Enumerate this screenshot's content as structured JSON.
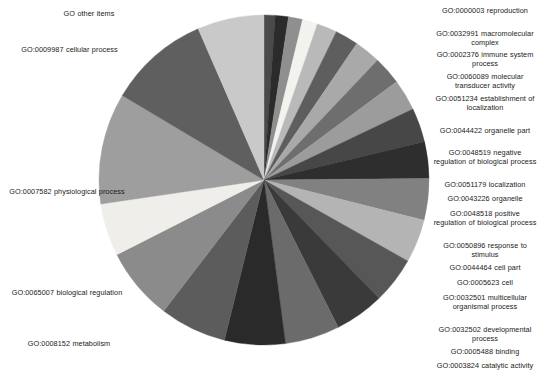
{
  "chart_data": {
    "type": "pie",
    "title": "",
    "legend_position": "outside-labels",
    "grid": false,
    "center": {
      "x": 264,
      "y": 180
    },
    "radius": 165,
    "start_angle_deg": -90,
    "direction": "clockwise",
    "categories": [
      "GO:0000003 reproduction",
      "GO:0032991 macromolecular complex",
      "GO:0002376 immune system process",
      "GO:0060089 molecular transducer activity",
      "GO:0051234 establishment of localization",
      "GO:0044422 organelle part",
      "GO:0048519 negative regulation of biological process",
      "GO:0051179 localization",
      "GO:0043226 organelle",
      "GO:0048518 positive regulation of biological process",
      "GO:0050896 response to stimulus",
      "GO:0044464 cell part",
      "GO:0005623 cell",
      "GO:0032501 multicellular organismal process",
      "GO:0032502 developmental process",
      "GO:0005488 binding",
      "GO:0003824 catalytic activity",
      "GO:0050789 regulation of biological process",
      "GO:0008152 metabolism",
      "GO:0065007 biological regulation",
      "GO:0007582 physiological process",
      "GO:0009987 cellular process",
      "GO other items"
    ],
    "values": [
      1.1,
      1.3,
      1.4,
      1.5,
      2.0,
      2.3,
      2.6,
      2.8,
      3.1,
      3.4,
      3.6,
      4.1,
      4.3,
      4.6,
      4.9,
      5.4,
      6.0,
      6.6,
      7.2,
      5.2,
      11.0,
      10.0,
      6.6
    ],
    "colors": [
      "#4a4a4a",
      "#2b2b2b",
      "#8f8f8f",
      "#f2f2ef",
      "#b9b9b9",
      "#5e5e5e",
      "#a9a9a9",
      "#6e6e6e",
      "#9c9c9c",
      "#474747",
      "#2e2e2e",
      "#818181",
      "#b4b4b4",
      "#575757",
      "#3a3a3a",
      "#6b6b6b",
      "#2a2a2a",
      "#5c5c5c",
      "#8b8b8b",
      "#efeeea",
      "#9e9e9e",
      "#5f5f5f",
      "#c9c9c9"
    ],
    "xlabel": "",
    "ylabel": ""
  },
  "labels_left": [
    {
      "text": "GO other items",
      "x": 14,
      "y": 9,
      "w": 150
    },
    {
      "text": "GO:0009987 cellular process",
      "x": 2,
      "y": 45,
      "w": 135
    },
    {
      "text": "GO:0007582 physiological process",
      "x": 3,
      "y": 187,
      "w": 128
    },
    {
      "text": "GO:0065007 biological regulation",
      "x": 3,
      "y": 288,
      "w": 128
    },
    {
      "text": "GO:0008152 metabolism",
      "x": 5,
      "y": 339,
      "w": 128
    }
  ],
  "labels_right": [
    {
      "text": "GO:0000003 reproduction",
      "x": 432,
      "y": 6,
      "w": 106
    },
    {
      "text": "GO:0032991 macromolecular complex",
      "x": 430,
      "y": 29,
      "w": 110
    },
    {
      "text": "GO:0002376 immune system process",
      "x": 432,
      "y": 50,
      "w": 106
    },
    {
      "text": "GO:0060089 molecular transducer activity",
      "x": 432,
      "y": 72,
      "w": 106
    },
    {
      "text": "GO:0051234 establishment of localization",
      "x": 435,
      "y": 94,
      "w": 100
    },
    {
      "text": "GO:0044422 organelle part",
      "x": 432,
      "y": 126,
      "w": 106
    },
    {
      "text": "GO:0048519 negative regulation of biological process",
      "x": 433,
      "y": 148,
      "w": 104
    },
    {
      "text": "GO:0051179 localization",
      "x": 432,
      "y": 180,
      "w": 106
    },
    {
      "text": "GO:0043226 organelle",
      "x": 432,
      "y": 194,
      "w": 106
    },
    {
      "text": "GO:0048518 positive regulation of biological process",
      "x": 433,
      "y": 209,
      "w": 104
    },
    {
      "text": "GO:0050896 response to stimulus",
      "x": 432,
      "y": 241,
      "w": 106
    },
    {
      "text": "GO:0044464 cell part",
      "x": 432,
      "y": 263,
      "w": 106
    },
    {
      "text": "GO:0005623 cell",
      "x": 432,
      "y": 278,
      "w": 106
    },
    {
      "text": "GO:0032501 multicellular organismal process",
      "x": 432,
      "y": 293,
      "w": 106
    },
    {
      "text": "GO:0032502 developmental process",
      "x": 432,
      "y": 325,
      "w": 106
    },
    {
      "text": "GO:0005488 binding",
      "x": 432,
      "y": 347,
      "w": 106
    },
    {
      "text": "GO:0003824 catalytic activity",
      "x": 432,
      "y": 361,
      "w": 106
    },
    {
      "text": "GO:0050789 regulation of biological process",
      "x": 431,
      "y": 383,
      "w": 108
    }
  ]
}
